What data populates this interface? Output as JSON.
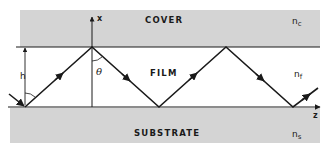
{
  "diagram": {
    "regions": {
      "cover": "COVER",
      "film": "FILM",
      "substrate": "SUBSTRATE"
    },
    "indices": {
      "cover": {
        "base": "n",
        "sub": "c"
      },
      "film": {
        "base": "n",
        "sub": "f"
      },
      "substrate": {
        "base": "n",
        "sub": "s"
      }
    },
    "axes": {
      "vertical": "x",
      "horizontal": "z"
    },
    "symbols": {
      "thickness": "h",
      "angle": "θ"
    },
    "colors": {
      "cladding_fill": "#d4d4d4",
      "line": "#1a1a1a",
      "background": "#ffffff"
    },
    "ray_path": [
      [
        25,
        107
      ],
      [
        92,
        47
      ],
      [
        159,
        107
      ],
      [
        226,
        47
      ],
      [
        293,
        107
      ],
      [
        318,
        88
      ]
    ]
  }
}
